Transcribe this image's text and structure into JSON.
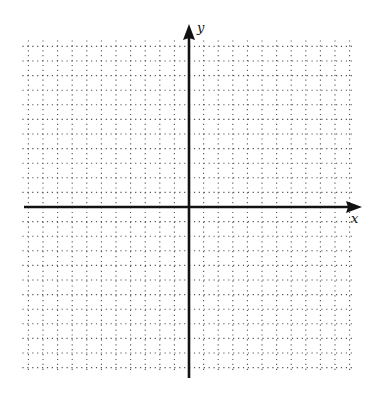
{
  "diagram": {
    "type": "coordinate-plane",
    "axes": {
      "x_label": "x",
      "y_label": "y",
      "x_range": [
        -11,
        11
      ],
      "y_range": [
        -11,
        11
      ]
    },
    "grid": {
      "style": "dotted",
      "columns": 22,
      "rows": 22
    },
    "colors": {
      "axis": "#111111",
      "grid": "#555555",
      "background": "#ffffff"
    }
  }
}
